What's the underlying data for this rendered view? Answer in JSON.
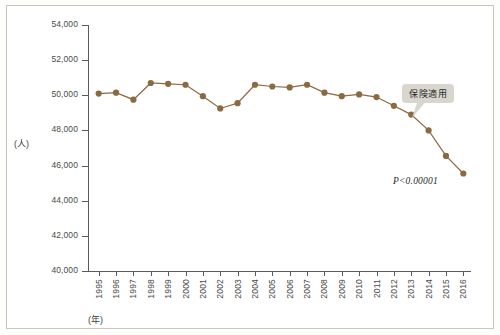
{
  "chart_data": {
    "type": "line",
    "title": "",
    "xlabel": "(年)",
    "ylabel": "(人)",
    "ylim": [
      40000,
      54000
    ],
    "ytick_step": 2000,
    "ytick_labels": [
      "54,000",
      "52,000",
      "50,000",
      "48,000",
      "46,000",
      "44,000",
      "42,000",
      "40,000"
    ],
    "ytick_values": [
      54000,
      52000,
      50000,
      48000,
      46000,
      44000,
      42000,
      40000
    ],
    "grid": false,
    "legend": "none",
    "series_color": "#8a6a42",
    "categories": [
      "1995",
      "1996",
      "1997",
      "1998",
      "1999",
      "2000",
      "2001",
      "2002",
      "2003",
      "2004",
      "2005",
      "2006",
      "2007",
      "2008",
      "2009",
      "2010",
      "2011",
      "2012",
      "2013",
      "2014",
      "2015",
      "2016"
    ],
    "series": [
      {
        "name": "人数",
        "values": [
          50100,
          50150,
          49750,
          50700,
          50650,
          50600,
          49950,
          49250,
          49550,
          50600,
          50500,
          50450,
          50600,
          50150,
          49950,
          50050,
          49900,
          49400,
          48900,
          48000,
          46550,
          45550
        ]
      }
    ],
    "annotations": [
      {
        "name": "callout",
        "text": "保険適用",
        "target_category": "2014"
      },
      {
        "name": "p-value",
        "text": "P<0.00001"
      }
    ]
  },
  "axes": {
    "y_unit_label": "(人)",
    "x_unit_label": "(年)"
  }
}
